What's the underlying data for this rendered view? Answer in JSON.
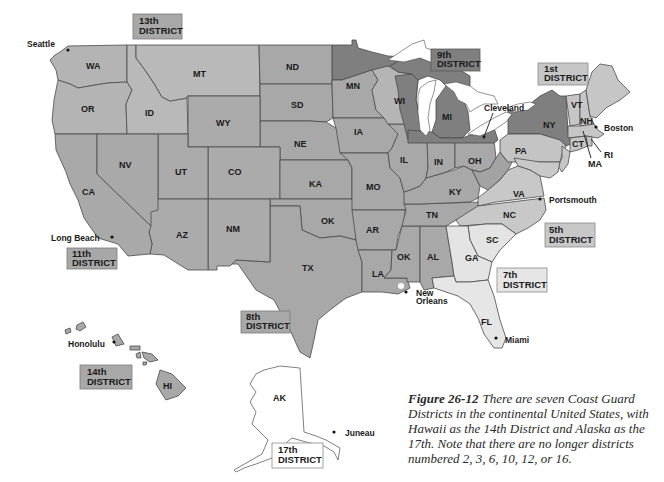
{
  "colors": {
    "district_13_11_8_14": "#a8a8a8",
    "district_9": "#7f7f7f",
    "district_1": "#c6c6c6",
    "district_5": "#c8c8c8",
    "district_7": "#e6e6e6",
    "district_17": "#ffffff",
    "mid_states": "#a0a0a0",
    "border": "#4a4a4a"
  },
  "districts": [
    {
      "id": "13",
      "line1": "13th",
      "line2": "DISTRICT"
    },
    {
      "id": "9",
      "line1": "9th",
      "line2": "DISTRICT"
    },
    {
      "id": "1",
      "line1": "1st",
      "line2": "DISTRICT"
    },
    {
      "id": "11",
      "line1": "11th",
      "line2": "DISTRICT"
    },
    {
      "id": "5",
      "line1": "5th",
      "line2": "DISTRICT"
    },
    {
      "id": "7",
      "line1": "7th",
      "line2": "DISTRICT"
    },
    {
      "id": "8",
      "line1": "8th",
      "line2": "DISTRICT"
    },
    {
      "id": "14",
      "line1": "14th",
      "line2": "DISTRICT"
    },
    {
      "id": "17",
      "line1": "17th",
      "line2": "DISTRICT"
    }
  ],
  "states": {
    "WA": "WA",
    "OR": "OR",
    "ID": "ID",
    "MT": "MT",
    "WY": "WY",
    "ND": "ND",
    "SD": "SD",
    "NE": "NE",
    "CA": "CA",
    "NV": "NV",
    "UT": "UT",
    "CO": "CO",
    "KA": "KA",
    "AZ": "AZ",
    "NM": "NM",
    "OK": "OK",
    "TX": "TX",
    "MN": "MN",
    "IA": "IA",
    "WI": "WI",
    "MI": "MI",
    "IL": "IL",
    "IN": "IN",
    "OH": "OH",
    "MO": "MO",
    "KY": "KY",
    "AR": "AR",
    "TN": "TN",
    "LA": "LA",
    "MS": "OK",
    "AL": "AL",
    "NY": "NY",
    "PA": "PA",
    "VT": "VT",
    "NH": "NH",
    "MA": "MA",
    "CT": "CT",
    "RI": "RI",
    "VA": "VA",
    "NC": "NC",
    "SC": "SC",
    "GA": "GA",
    "FL": "FL",
    "HI": "HI",
    "AK": "AK"
  },
  "cities": {
    "seattle": "Seattle",
    "long_beach": "Long Beach",
    "cleveland": "Cleveland",
    "boston": "Boston",
    "portsmouth": "Portsmouth",
    "new_orleans_1": "New",
    "new_orleans_2": "Orleans",
    "miami": "Miami",
    "honolulu": "Honolulu",
    "juneau": "Juneau"
  },
  "caption": {
    "figure_label": "Figure 26-12",
    "text": "There are seven Coast Guard Districts in the continental United States, with Hawaii as the 14th District and Alaska as the 17th. Note that there are no longer districts numbered 2, 3, 6, 10, 12, or 16."
  }
}
